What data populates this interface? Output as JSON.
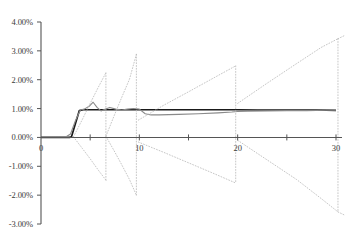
{
  "chart_data": {
    "type": "line",
    "title": "",
    "xlabel": "",
    "ylabel": "",
    "xlim": [
      0,
      31
    ],
    "ylim": [
      -0.03,
      0.04
    ],
    "grid": false,
    "legend": null,
    "y_ticks": [
      {
        "value": 0.04,
        "label": "4.00%"
      },
      {
        "value": 0.03,
        "label": "3.00%"
      },
      {
        "value": 0.02,
        "label": "2.00%"
      },
      {
        "value": 0.01,
        "label": "1.00%"
      },
      {
        "value": 0.0,
        "label": "0.00%"
      },
      {
        "value": -0.01,
        "label": "-1.00%"
      },
      {
        "value": -0.02,
        "label": "-2.00%"
      },
      {
        "value": -0.03,
        "label": "-3.00%"
      }
    ],
    "x_ticks": [
      {
        "value": 0,
        "label": "0",
        "major": true
      },
      {
        "value": 5,
        "label": "",
        "major": false
      },
      {
        "value": 10,
        "label": "10",
        "major": true
      },
      {
        "value": 15,
        "label": "",
        "major": false
      },
      {
        "value": 20,
        "label": "20",
        "major": true
      },
      {
        "value": 25,
        "label": "",
        "major": false
      },
      {
        "value": 30,
        "label": "30",
        "major": true
      }
    ],
    "colors": {
      "axis": "#555555",
      "series_main": "#1a1a1a",
      "series_secondary": "#8a8a8a",
      "series_bands": "#b8b8b8",
      "text": "#3a3a3a",
      "background": "#ffffff"
    },
    "series": [
      {
        "name": "main-step",
        "style": "solid",
        "color": "#1a1a1a",
        "width": 1.7,
        "points": [
          [
            0.0,
            0.0
          ],
          [
            1.0,
            0.0
          ],
          [
            2.0,
            0.0
          ],
          [
            2.9,
            0.0
          ],
          [
            3.1,
            0.0002
          ],
          [
            3.9,
            0.0093
          ],
          [
            4.3,
            0.0096
          ],
          [
            5.0,
            0.0096
          ],
          [
            6.0,
            0.0096
          ],
          [
            7.0,
            0.0096
          ],
          [
            8.0,
            0.0096
          ],
          [
            9.0,
            0.0096
          ],
          [
            10.0,
            0.0096
          ],
          [
            12.0,
            0.0096
          ],
          [
            14.0,
            0.0096
          ],
          [
            16.0,
            0.0096
          ],
          [
            18.0,
            0.0096
          ],
          [
            20.0,
            0.0096
          ],
          [
            22.0,
            0.0095
          ],
          [
            24.0,
            0.0095
          ],
          [
            26.0,
            0.0095
          ],
          [
            28.0,
            0.0095
          ],
          [
            30.0,
            0.0094
          ]
        ]
      },
      {
        "name": "secondary-wobble",
        "style": "solid",
        "color": "#8a8a8a",
        "width": 1.1,
        "points": [
          [
            0.0,
            0.0
          ],
          [
            1.0,
            0.0001
          ],
          [
            2.0,
            0.0002
          ],
          [
            2.6,
            0.0003
          ],
          [
            3.0,
            0.0012
          ],
          [
            3.5,
            0.0058
          ],
          [
            4.0,
            0.0095
          ],
          [
            4.4,
            0.0098
          ],
          [
            4.9,
            0.0108
          ],
          [
            5.3,
            0.0122
          ],
          [
            5.7,
            0.0104
          ],
          [
            6.1,
            0.0092
          ],
          [
            6.5,
            0.0098
          ],
          [
            7.0,
            0.0104
          ],
          [
            7.6,
            0.0098
          ],
          [
            8.2,
            0.0095
          ],
          [
            8.8,
            0.0098
          ],
          [
            9.4,
            0.01
          ],
          [
            10.0,
            0.0098
          ],
          [
            10.6,
            0.0082
          ],
          [
            11.2,
            0.0078
          ],
          [
            12.0,
            0.0078
          ],
          [
            13.0,
            0.0079
          ],
          [
            14.0,
            0.008
          ],
          [
            16.0,
            0.0082
          ],
          [
            18.0,
            0.0085
          ],
          [
            19.4,
            0.0088
          ],
          [
            20.0,
            0.009
          ],
          [
            21.0,
            0.0091
          ],
          [
            23.0,
            0.0092
          ],
          [
            25.0,
            0.0093
          ],
          [
            27.0,
            0.0093
          ],
          [
            29.0,
            0.0094
          ],
          [
            30.0,
            0.0094
          ]
        ]
      },
      {
        "name": "band-cone-1-upper",
        "style": "dotted",
        "color": "#b8b8b8",
        "width": 0.8,
        "points": [
          [
            3.3,
            0.0002
          ],
          [
            4.2,
            0.0062
          ],
          [
            5.0,
            0.0118
          ],
          [
            5.8,
            0.0172
          ],
          [
            6.6,
            0.0224
          ]
        ]
      },
      {
        "name": "band-cone-1-lower",
        "style": "dotted",
        "color": "#b8b8b8",
        "width": 0.8,
        "points": [
          [
            3.3,
            0.0002
          ],
          [
            4.2,
            -0.0038
          ],
          [
            5.0,
            -0.0074
          ],
          [
            5.8,
            -0.0112
          ],
          [
            6.6,
            -0.0148
          ]
        ]
      },
      {
        "name": "band-cone-1-reset",
        "style": "dotted",
        "color": "#b8b8b8",
        "width": 0.8,
        "points": [
          [
            6.6,
            0.0224
          ],
          [
            6.6,
            -0.0148
          ]
        ]
      },
      {
        "name": "band-cone-2-upper",
        "style": "dotted",
        "color": "#b8b8b8",
        "width": 0.8,
        "points": [
          [
            6.6,
            0.0004
          ],
          [
            7.4,
            0.0072
          ],
          [
            8.2,
            0.0138
          ],
          [
            9.0,
            0.0202
          ],
          [
            9.7,
            0.0288
          ]
        ]
      },
      {
        "name": "band-cone-2-lower",
        "style": "dotted",
        "color": "#b8b8b8",
        "width": 0.8,
        "points": [
          [
            6.6,
            0.0004
          ],
          [
            7.4,
            -0.0044
          ],
          [
            8.2,
            -0.0094
          ],
          [
            9.0,
            -0.0146
          ],
          [
            9.7,
            -0.02
          ]
        ]
      },
      {
        "name": "band-cone-2-reset",
        "style": "dotted",
        "color": "#b8b8b8",
        "width": 0.8,
        "points": [
          [
            9.7,
            0.0288
          ],
          [
            9.7,
            -0.02
          ]
        ]
      },
      {
        "name": "band-cone-3-upper",
        "style": "dotted",
        "color": "#b8b8b8",
        "width": 0.8,
        "points": [
          [
            9.9,
            0.006
          ],
          [
            12.5,
            0.0112
          ],
          [
            15.0,
            0.0158
          ],
          [
            17.5,
            0.0205
          ],
          [
            19.8,
            0.0248
          ]
        ]
      },
      {
        "name": "band-cone-3-lower",
        "style": "dotted",
        "color": "#b8b8b8",
        "width": 0.8,
        "points": [
          [
            9.9,
            -0.0016
          ],
          [
            12.5,
            -0.0052
          ],
          [
            15.0,
            -0.0088
          ],
          [
            17.5,
            -0.0124
          ],
          [
            19.8,
            -0.0158
          ]
        ]
      },
      {
        "name": "band-cone-3-reset",
        "style": "dotted",
        "color": "#b8b8b8",
        "width": 0.8,
        "points": [
          [
            19.8,
            0.0248
          ],
          [
            19.8,
            -0.0158
          ]
        ]
      },
      {
        "name": "band-cone-4-upper",
        "style": "dotted",
        "color": "#b8b8b8",
        "width": 0.8,
        "points": [
          [
            20.0,
            0.0118
          ],
          [
            23.0,
            0.0188
          ],
          [
            26.0,
            0.0256
          ],
          [
            28.5,
            0.0312
          ],
          [
            30.2,
            0.0342
          ]
        ]
      },
      {
        "name": "band-cone-4-lower",
        "style": "dotted",
        "color": "#b8b8b8",
        "width": 0.8,
        "points": [
          [
            20.0,
            -0.001
          ],
          [
            23.0,
            -0.0078
          ],
          [
            26.0,
            -0.0146
          ],
          [
            28.5,
            -0.0212
          ],
          [
            30.2,
            -0.0258
          ]
        ]
      },
      {
        "name": "band-cone-4-reset",
        "style": "dotted",
        "color": "#b8b8b8",
        "width": 0.8,
        "points": [
          [
            30.2,
            0.0342
          ],
          [
            30.2,
            -0.0258
          ]
        ]
      },
      {
        "name": "band-tail-upper",
        "style": "dotted",
        "color": "#b8b8b8",
        "width": 0.8,
        "points": [
          [
            30.2,
            0.0342
          ],
          [
            30.8,
            0.0352
          ]
        ]
      },
      {
        "name": "band-tail-lower",
        "style": "dotted",
        "color": "#b8b8b8",
        "width": 0.8,
        "points": [
          [
            30.2,
            -0.0258
          ],
          [
            30.8,
            -0.0268
          ]
        ]
      }
    ]
  }
}
